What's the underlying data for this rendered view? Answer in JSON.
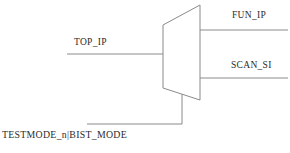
{
  "diagram": {
    "type": "multiplexer-schematic",
    "stroke_color": "#8a8a8a",
    "text_color": "#2b2b2b",
    "background_color": "#ffffff",
    "mux": {
      "name": "mux-trapezoid",
      "shape": "trapezoid",
      "vertices": [
        [
          163,
          25
        ],
        [
          200,
          5
        ],
        [
          200,
          100
        ],
        [
          163,
          88
        ]
      ]
    },
    "ports": {
      "input_left": {
        "label": "TOP_IP",
        "wire": {
          "x1": 67,
          "y1": 54,
          "x2": 163,
          "y2": 54
        }
      },
      "output_top": {
        "label": "FUN_IP",
        "wire": {
          "x1": 200,
          "y1": 30,
          "x2": 288,
          "y2": 30
        }
      },
      "output_bottom": {
        "label": "SCAN_SI",
        "wire": {
          "x1": 200,
          "y1": 78,
          "x2": 288,
          "y2": 78
        }
      },
      "select_bottom": {
        "label": "TESTMODE_n|BIST_MODE",
        "wire_path": "M 182 94 L 182 124 L 87 124"
      }
    }
  }
}
